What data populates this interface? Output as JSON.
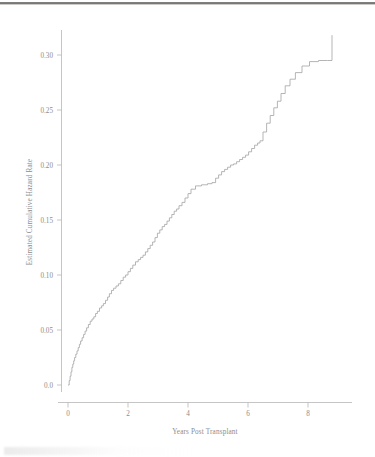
{
  "figure": {
    "type": "statistical-figure",
    "background_color": "#ffffff",
    "line_color": "#a8a8a8",
    "axis_color": "#b6b6b6",
    "text_color": "#8c8c8c"
  },
  "artifacts": {
    "top_edge_label": "scan-edge-shadow",
    "bottom_smudge_label": "scan-bottom-artifact"
  },
  "chart_data": {
    "type": "line",
    "title": "",
    "subtitle": "",
    "xlabel": "Years Post Transplant",
    "ylabel": "Estimated Cumulative Hazard Rate",
    "xlim": [
      -0.35,
      9.4
    ],
    "ylim": [
      -0.012,
      0.335
    ],
    "xticks": [
      0,
      2,
      4,
      6,
      8
    ],
    "xticklabels": [
      "0",
      "2",
      "4",
      "6",
      "8"
    ],
    "yticks": [
      0.0,
      0.05,
      0.1,
      0.15,
      0.2,
      0.25,
      0.3
    ],
    "yticklabels": [
      "0.0",
      "0.05",
      "0.10",
      "0.15",
      "0.20",
      "0.25",
      "0.30"
    ],
    "grid": false,
    "legend": null,
    "legend_position": "none",
    "annotations": [],
    "series": [
      {
        "name": "Estimated cumulative hazard",
        "style": "step",
        "color": "#a8a8a8",
        "x": [
          0.0,
          0.04,
          0.07,
          0.1,
          0.13,
          0.16,
          0.19,
          0.22,
          0.26,
          0.3,
          0.34,
          0.38,
          0.42,
          0.47,
          0.52,
          0.57,
          0.62,
          0.68,
          0.74,
          0.8,
          0.86,
          0.92,
          0.98,
          1.05,
          1.12,
          1.18,
          1.25,
          1.32,
          1.38,
          1.45,
          1.52,
          1.6,
          1.68,
          1.76,
          1.84,
          1.92,
          2.0,
          2.08,
          2.16,
          2.25,
          2.34,
          2.42,
          2.5,
          2.58,
          2.66,
          2.74,
          2.82,
          2.9,
          2.98,
          3.06,
          3.14,
          3.22,
          3.3,
          3.38,
          3.46,
          3.54,
          3.62,
          3.7,
          3.8,
          3.9,
          4.0,
          4.1,
          4.25,
          4.45,
          4.65,
          4.8,
          4.92,
          5.02,
          5.12,
          5.22,
          5.32,
          5.42,
          5.52,
          5.62,
          5.72,
          5.82,
          5.92,
          6.02,
          6.12,
          6.22,
          6.32,
          6.4,
          6.5,
          6.62,
          6.74,
          6.86,
          6.98,
          7.1,
          7.24,
          7.4,
          7.58,
          7.8,
          8.05,
          8.35,
          8.65,
          8.8
        ],
        "y": [
          0.0,
          0.004,
          0.008,
          0.012,
          0.016,
          0.019,
          0.022,
          0.025,
          0.028,
          0.031,
          0.034,
          0.037,
          0.04,
          0.043,
          0.046,
          0.049,
          0.052,
          0.055,
          0.058,
          0.06,
          0.062,
          0.065,
          0.067,
          0.07,
          0.072,
          0.074,
          0.077,
          0.08,
          0.083,
          0.086,
          0.088,
          0.09,
          0.092,
          0.095,
          0.098,
          0.1,
          0.103,
          0.106,
          0.109,
          0.112,
          0.114,
          0.116,
          0.118,
          0.121,
          0.124,
          0.127,
          0.13,
          0.134,
          0.138,
          0.141,
          0.144,
          0.146,
          0.149,
          0.152,
          0.155,
          0.158,
          0.16,
          0.163,
          0.166,
          0.17,
          0.174,
          0.178,
          0.181,
          0.182,
          0.183,
          0.184,
          0.188,
          0.191,
          0.194,
          0.196,
          0.198,
          0.2,
          0.201,
          0.203,
          0.205,
          0.207,
          0.209,
          0.212,
          0.215,
          0.218,
          0.22,
          0.222,
          0.23,
          0.238,
          0.245,
          0.252,
          0.258,
          0.265,
          0.272,
          0.278,
          0.284,
          0.29,
          0.294,
          0.295,
          0.295,
          0.318
        ]
      }
    ]
  }
}
